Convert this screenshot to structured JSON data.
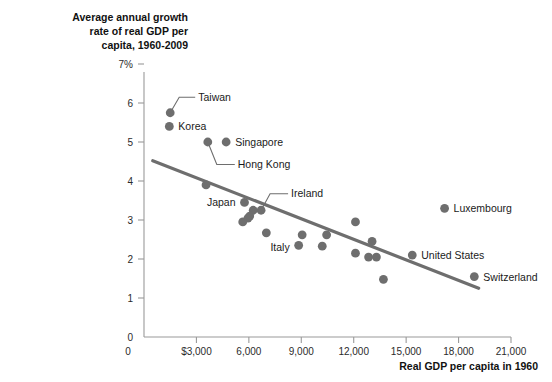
{
  "chart_data": {
    "type": "scatter",
    "title": "Average annual growth\nrate of real GDP per\ncapita, 1960-2009",
    "xlabel": "Real GDP per capita in 1960",
    "ylabel": "",
    "xlim": [
      0,
      21000
    ],
    "ylim": [
      0,
      7
    ],
    "grid": false,
    "legend_position": "none",
    "xticks": [
      {
        "value": 0,
        "label": "0"
      },
      {
        "value": 3000,
        "label": "$3,000"
      },
      {
        "value": 6000,
        "label": "6,000"
      },
      {
        "value": 9000,
        "label": "9,000"
      },
      {
        "value": 12000,
        "label": "12,000"
      },
      {
        "value": 15000,
        "label": "15,000"
      },
      {
        "value": 18000,
        "label": "18,000"
      },
      {
        "value": 21000,
        "label": "21,000"
      }
    ],
    "yticks": [
      {
        "value": 0,
        "label": "0"
      },
      {
        "value": 1,
        "label": "1"
      },
      {
        "value": 2,
        "label": "2"
      },
      {
        "value": 3,
        "label": "3"
      },
      {
        "value": 4,
        "label": "4"
      },
      {
        "value": 5,
        "label": "5"
      },
      {
        "value": 6,
        "label": "6"
      },
      {
        "value": 7,
        "label": "7%"
      }
    ],
    "points": [
      {
        "x": 1500,
        "y": 5.75,
        "label": "Taiwan",
        "label_side": "leader",
        "label_dx": 28,
        "label_dy": -12
      },
      {
        "x": 1450,
        "y": 5.4,
        "label": "Korea",
        "label_side": "right",
        "label_dx": 9,
        "label_dy": 4
      },
      {
        "x": 3650,
        "y": 5.0,
        "label": "Hong Kong",
        "label_side": "leader",
        "label_dx": 30,
        "label_dy": 26
      },
      {
        "x": 4700,
        "y": 5.0,
        "label": "Singapore",
        "label_side": "right",
        "label_dx": 9,
        "label_dy": 4
      },
      {
        "x": 3550,
        "y": 3.9,
        "label": "",
        "label_side": "none"
      },
      {
        "x": 5750,
        "y": 3.45,
        "label": "Japan",
        "label_side": "left",
        "label_dx": -9,
        "label_dy": 4
      },
      {
        "x": 6700,
        "y": 3.25,
        "label": "Ireland",
        "label_side": "leader",
        "label_dx": 30,
        "label_dy": -13
      },
      {
        "x": 6250,
        "y": 3.25,
        "label": "",
        "label_side": "none"
      },
      {
        "x": 6050,
        "y": 3.1,
        "label": "",
        "label_side": "none"
      },
      {
        "x": 5950,
        "y": 3.05,
        "label": "",
        "label_side": "none"
      },
      {
        "x": 5650,
        "y": 2.95,
        "label": "",
        "label_side": "none"
      },
      {
        "x": 7000,
        "y": 2.67,
        "label": "",
        "label_side": "none"
      },
      {
        "x": 8850,
        "y": 2.35,
        "label": "Italy",
        "label_side": "left",
        "label_dx": -9,
        "label_dy": 6
      },
      {
        "x": 9050,
        "y": 2.62,
        "label": "",
        "label_side": "none"
      },
      {
        "x": 10200,
        "y": 2.33,
        "label": "",
        "label_side": "none"
      },
      {
        "x": 10450,
        "y": 2.62,
        "label": "",
        "label_side": "none"
      },
      {
        "x": 12100,
        "y": 2.95,
        "label": "",
        "label_side": "none"
      },
      {
        "x": 12100,
        "y": 2.15,
        "label": "",
        "label_side": "none"
      },
      {
        "x": 13050,
        "y": 2.45,
        "label": "",
        "label_side": "none"
      },
      {
        "x": 12850,
        "y": 2.05,
        "label": "",
        "label_side": "none"
      },
      {
        "x": 13300,
        "y": 2.05,
        "label": "",
        "label_side": "none"
      },
      {
        "x": 13700,
        "y": 1.48,
        "label": "",
        "label_side": "none"
      },
      {
        "x": 17200,
        "y": 3.3,
        "label": "Luxembourg",
        "label_side": "right",
        "label_dx": 9,
        "label_dy": 4
      },
      {
        "x": 15350,
        "y": 2.1,
        "label": "United States",
        "label_side": "right",
        "label_dx": 9,
        "label_dy": 4
      },
      {
        "x": 18900,
        "y": 1.55,
        "label": "Switzerland",
        "label_side": "right",
        "label_dx": 9,
        "label_dy": 4
      }
    ],
    "trend_line": {
      "x_start": 500,
      "y_start": 4.52,
      "x_end": 19150,
      "y_end": 1.25,
      "color": "#6e6e6e"
    },
    "colors": {
      "point": "#6e6e6e",
      "line": "#6e6e6e",
      "axis": "#9a9a9a",
      "text": "#1a1a1a",
      "background": "#ffffff"
    }
  }
}
